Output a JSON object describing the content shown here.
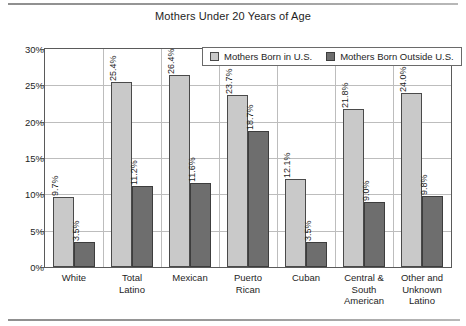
{
  "chart_data": {
    "type": "bar",
    "title": "Mothers Under 20 Years of Age",
    "xlabel": "",
    "ylabel": "",
    "ylim": [
      0,
      30
    ],
    "ytick_labels": [
      "0%",
      "5%",
      "10%",
      "15%",
      "20%",
      "25%",
      "30%"
    ],
    "ytick_values": [
      0,
      5,
      10,
      15,
      20,
      25,
      30
    ],
    "grid": true,
    "legend_position": "top-right-inside",
    "categories": [
      "White",
      "Total Latino",
      "Mexican",
      "Puerto Rican",
      "Cuban",
      "Central & South American",
      "Other and Unknown Latino"
    ],
    "category_lines": [
      [
        "White"
      ],
      [
        "Total",
        "Latino"
      ],
      [
        "Mexican"
      ],
      [
        "Puerto",
        "Rican"
      ],
      [
        "Cuban"
      ],
      [
        "Central &",
        "South",
        "American"
      ],
      [
        "Other and",
        "Unknown",
        "Latino"
      ]
    ],
    "series": [
      {
        "name": "Mothers Born in U.S.",
        "color": "#c9c9c9",
        "values": [
          9.7,
          25.4,
          26.4,
          23.7,
          12.1,
          21.8,
          24.0
        ],
        "labels": [
          "9.7%",
          "25.4%",
          "26.4%",
          "23.7%",
          "12.1%",
          "21.8%",
          "24.0%"
        ]
      },
      {
        "name": "Mothers Born Outside U.S.",
        "color": "#6e6e6e",
        "values": [
          3.5,
          11.2,
          11.6,
          18.7,
          3.5,
          9.0,
          9.8
        ],
        "labels": [
          "3.5%",
          "11.2%",
          "11.6%",
          "18.7%",
          "3.5%",
          "9.0%",
          "9.8%"
        ]
      }
    ]
  }
}
